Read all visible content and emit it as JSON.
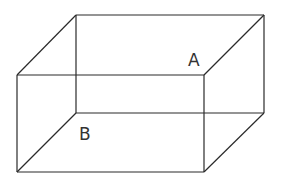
{
  "figure": {
    "type": "cuboid",
    "stroke_color": "#2a2a2a",
    "background": "#ffffff",
    "vertices": {
      "front_top_left": [
        17,
        75
      ],
      "front_top_right": [
        204,
        75
      ],
      "front_bottom_left": [
        17,
        172
      ],
      "front_bottom_right": [
        204,
        172
      ],
      "back_top_left": [
        76,
        15
      ],
      "back_top_right": [
        264,
        15
      ],
      "back_bottom_left": [
        76,
        113
      ],
      "back_bottom_right": [
        264,
        113
      ]
    },
    "labels": [
      {
        "text": "A",
        "x": 188,
        "y": 66
      },
      {
        "text": "B",
        "x": 79,
        "y": 140
      }
    ]
  }
}
